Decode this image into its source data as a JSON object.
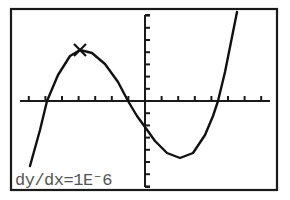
{
  "calculator_graph": {
    "frame": {
      "x": 11,
      "y": 9,
      "width": 266,
      "height": 181,
      "color": "#1a1a1a"
    },
    "axes": {
      "x_axis_y": 101,
      "y_axis_x": 145,
      "x_range_px": [
        20,
        270
      ],
      "y_range_px": [
        15,
        187
      ],
      "x_tick_count_left": 7,
      "x_tick_count_right": 7,
      "x_tick_spacing": 16.6,
      "y_tick_spacing": 12.2,
      "color": "#1a1a1a"
    },
    "curve": {
      "description": "cubic function graph",
      "color": "#111111",
      "points": [
        [
          30,
          166
        ],
        [
          40,
          130
        ],
        [
          47,
          101
        ],
        [
          58,
          75
        ],
        [
          70,
          56
        ],
        [
          80,
          50
        ],
        [
          92,
          53
        ],
        [
          105,
          64
        ],
        [
          118,
          82
        ],
        [
          128,
          101
        ],
        [
          137,
          116
        ],
        [
          145,
          127
        ],
        [
          155,
          141
        ],
        [
          167,
          153
        ],
        [
          180,
          158
        ],
        [
          193,
          153
        ],
        [
          205,
          135
        ],
        [
          213,
          116
        ],
        [
          218,
          101
        ],
        [
          225,
          72
        ],
        [
          231,
          42
        ],
        [
          237,
          12
        ]
      ]
    },
    "marker": {
      "symbol": "x-cross",
      "x": 80,
      "y": 50,
      "label": "trace cursor at local maximum"
    },
    "readout": {
      "text": "dy/dx=1E⁻6"
    }
  },
  "chart_data": {
    "type": "line",
    "title": "",
    "xlabel": "",
    "ylabel": "",
    "annotations": [
      "dy/dx=1E-6"
    ],
    "marker": "local maximum",
    "grid": false
  }
}
